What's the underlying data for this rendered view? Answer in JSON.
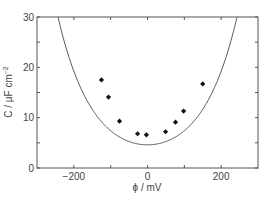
{
  "chart_data": {
    "type": "scatter",
    "title": "",
    "xlabel": "ϕ / mV",
    "ylabel": "C / μF cm⁻²",
    "xlim": [
      -300,
      300
    ],
    "ylim": [
      0,
      30
    ],
    "x_ticks_major": [
      -200,
      0,
      200
    ],
    "x_ticks_minor": [
      -100,
      100
    ],
    "y_ticks_major": [
      0,
      10,
      20,
      30
    ],
    "y_ticks_minor": [
      5,
      15,
      25
    ],
    "grid": false,
    "legend": null,
    "series": [
      {
        "name": "measured",
        "type": "scatter",
        "marker": "diamond",
        "color": "#111111",
        "x": [
          -125,
          -106,
          -76,
          -27,
          -3,
          49,
          76,
          98,
          150
        ],
        "y": [
          17.5,
          14.1,
          9.3,
          6.8,
          6.6,
          7.2,
          9.1,
          11.3,
          16.7
        ]
      },
      {
        "name": "theory",
        "type": "line",
        "color": "#555555",
        "function": "cosh",
        "min_value": 4.6,
        "crosses_top_at": [
          -243,
          243
        ]
      }
    ]
  },
  "labels": {
    "x_axis": "ϕ / mV",
    "y_axis_main": "C / μF cm",
    "y_axis_sup": "−2"
  }
}
